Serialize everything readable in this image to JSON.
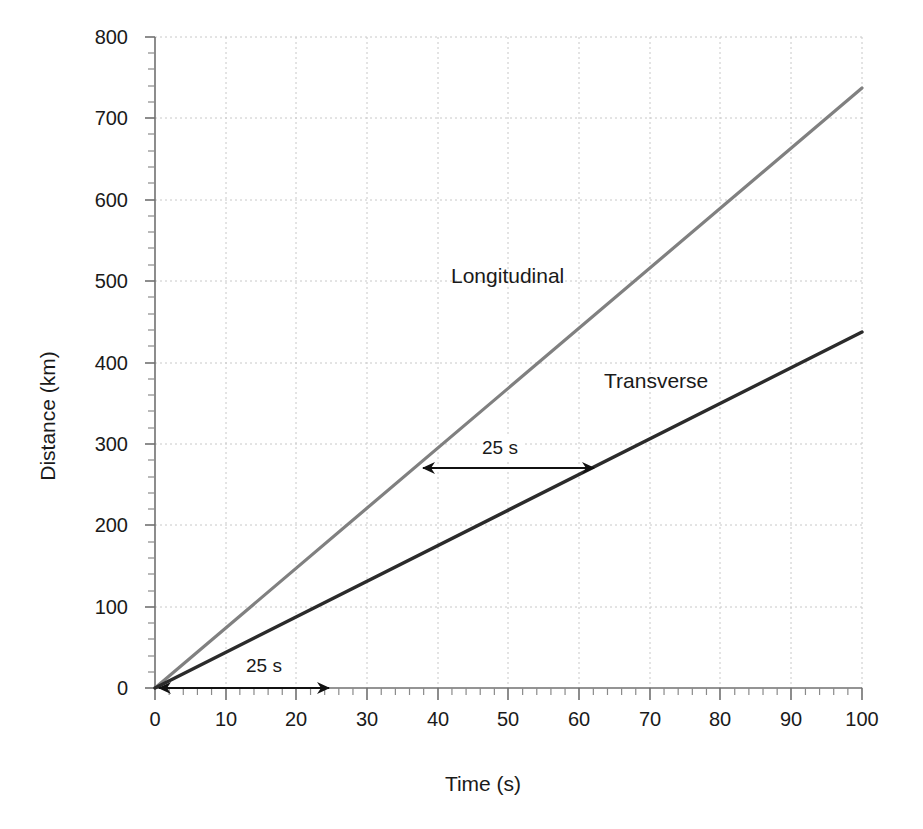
{
  "chart_data": {
    "type": "line",
    "title": "",
    "xlabel": "Time (s)",
    "ylabel": "Distance (km)",
    "xlim": [
      0,
      100
    ],
    "ylim": [
      0,
      800
    ],
    "xticks": [
      0,
      10,
      20,
      30,
      40,
      50,
      60,
      70,
      80,
      90,
      100
    ],
    "yticks": [
      0,
      100,
      200,
      300,
      400,
      500,
      600,
      700,
      800
    ],
    "x_minor_tick_step": 2,
    "y_minor_tick_step": 20,
    "grid": "dotted-light-gray, major gridlines on both axes",
    "legend_position": "inline series labels on plot",
    "series": [
      {
        "name": "Longitudinal",
        "color": "#808080",
        "x": [
          0,
          100
        ],
        "values": [
          0,
          737
        ],
        "slope_km_per_s": 7.37
      },
      {
        "name": "Transverse",
        "color": "#2b2b2b",
        "x": [
          0,
          100
        ],
        "values": [
          0,
          437
        ],
        "slope_km_per_s": 4.37
      }
    ],
    "annotations": [
      {
        "id": "lower-interval",
        "text": "25 s",
        "x_start": 0,
        "x_end": 25,
        "y": 0,
        "arrow": "double-headed-horizontal"
      },
      {
        "id": "upper-interval",
        "text": "25 s",
        "x_start": 37.5,
        "x_end": 62.5,
        "y": 268,
        "arrow": "double-headed-horizontal"
      }
    ]
  },
  "labels": {
    "ylabel": "Distance (km)",
    "xlabel": "Time (s)",
    "series_longitudinal": "Longitudinal",
    "series_transverse": "Transverse",
    "annot_lower": "25 s",
    "annot_upper": "25 s",
    "y_0": "0",
    "y_100": "100",
    "y_200": "200",
    "y_300": "300",
    "y_400": "400",
    "y_500": "500",
    "y_600": "600",
    "y_700": "700",
    "y_800": "800",
    "x_0": "0",
    "x_10": "10",
    "x_20": "20",
    "x_30": "30",
    "x_40": "40",
    "x_50": "50",
    "x_60": "60",
    "x_70": "70",
    "x_80": "80",
    "x_90": "90",
    "x_100": "100"
  },
  "colors": {
    "longitudinal": "#808080",
    "transverse": "#2b2b2b",
    "grid": "#c8c8c8",
    "axis": "#6e6e6e",
    "text": "#1a1a1a",
    "background": "#ffffff"
  }
}
